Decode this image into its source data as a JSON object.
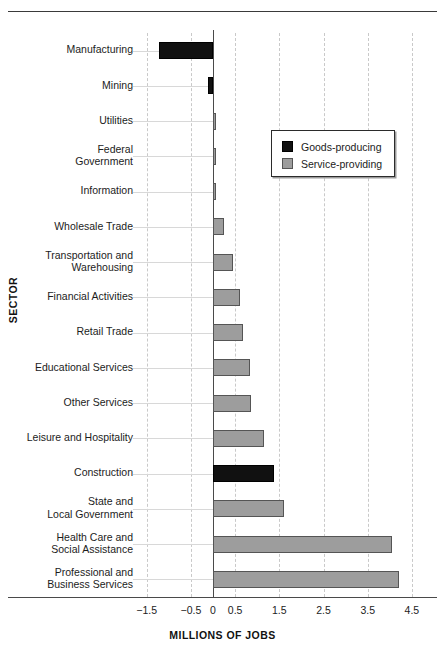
{
  "chart_data": {
    "type": "bar",
    "orientation": "horizontal",
    "title": "",
    "xlabel": "MILLIONS OF JOBS",
    "ylabel": "SECTOR",
    "xlim": [
      -1.5,
      4.5
    ],
    "xticks": [
      "-1.5",
      "-0.5",
      "0",
      "0.5",
      "1.5",
      "2.5",
      "3.5",
      "4.5"
    ],
    "xtick_values": [
      -1.5,
      -0.5,
      0,
      0.5,
      1.5,
      2.5,
      3.5,
      4.5
    ],
    "grid": "vertical-dashed",
    "legend_position": "upper-right-inside",
    "categories": [
      "Manufacturing",
      "Mining",
      "Utilities",
      "Federal\nGovernment",
      "Information",
      "Wholesale Trade",
      "Transportation and\nWarehousing",
      "Financial Activities",
      "Retail Trade",
      "Educational Services",
      "Other Services",
      "Leisure and Hospitality",
      "Construction",
      "State and\nLocal Government",
      "Health Care and\nSocial Assistance",
      "Professional and\nBusiness Services"
    ],
    "values": [
      -1.22,
      -0.11,
      0.04,
      0.05,
      0.07,
      0.25,
      0.45,
      0.6,
      0.68,
      0.83,
      0.85,
      1.15,
      1.38,
      1.6,
      4.05,
      4.2
    ],
    "groups": [
      "Goods-producing",
      "Goods-producing",
      "Service-providing",
      "Service-providing",
      "Service-providing",
      "Service-providing",
      "Service-providing",
      "Service-providing",
      "Service-providing",
      "Service-providing",
      "Service-providing",
      "Service-providing",
      "Goods-producing",
      "Service-providing",
      "Service-providing",
      "Service-providing"
    ],
    "series": [
      {
        "name": "Goods-producing",
        "color": "#111111",
        "points": [
          {
            "category": "Manufacturing",
            "value": -1.22
          },
          {
            "category": "Mining",
            "value": -0.11
          },
          {
            "category": "Construction",
            "value": 1.38
          }
        ]
      },
      {
        "name": "Service-providing",
        "color": "#9d9d9d",
        "points": [
          {
            "category": "Utilities",
            "value": 0.04
          },
          {
            "category": "Federal Government",
            "value": 0.05
          },
          {
            "category": "Information",
            "value": 0.07
          },
          {
            "category": "Wholesale Trade",
            "value": 0.25
          },
          {
            "category": "Transportation and Warehousing",
            "value": 0.45
          },
          {
            "category": "Financial Activities",
            "value": 0.6
          },
          {
            "category": "Retail Trade",
            "value": 0.68
          },
          {
            "category": "Educational Services",
            "value": 0.83
          },
          {
            "category": "Other Services",
            "value": 0.85
          },
          {
            "category": "Leisure and Hospitality",
            "value": 1.15
          },
          {
            "category": "State and Local Government",
            "value": 1.6
          },
          {
            "category": "Health Care and Social Assistance",
            "value": 4.05
          },
          {
            "category": "Professional and Business Services",
            "value": 4.2
          }
        ]
      }
    ]
  },
  "legend": {
    "items": [
      {
        "label": "Goods-producing",
        "color": "#111111"
      },
      {
        "label": "Service-providing",
        "color": "#9d9d9d"
      }
    ]
  },
  "axes": {
    "x_title": "MILLIONS OF JOBS",
    "y_title": "SECTOR"
  }
}
